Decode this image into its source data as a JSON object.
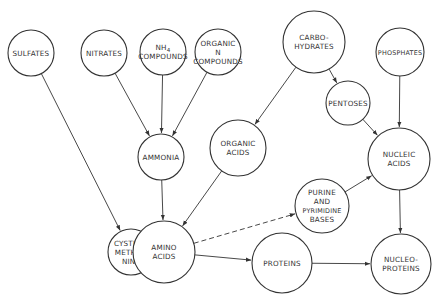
{
  "diagram": {
    "type": "metabolic-flow",
    "nodes": [
      {
        "id": "sulfates",
        "lines": [
          "SULFATES"
        ],
        "cx": 31,
        "cy": 53,
        "r": 23
      },
      {
        "id": "nitrates",
        "lines": [
          "NITRATES"
        ],
        "cx": 104,
        "cy": 53,
        "r": 23
      },
      {
        "id": "nh4",
        "lines": [
          "NH4",
          "COMPOUNDS"
        ],
        "cx": 163,
        "cy": 52,
        "r": 23
      },
      {
        "id": "organic_n",
        "lines": [
          "ORGANIC",
          "N",
          "COMPOUNDS"
        ],
        "cx": 218,
        "cy": 52,
        "r": 23
      },
      {
        "id": "carbohydrates",
        "lines": [
          "CARBO-",
          "HYDRATES"
        ],
        "cx": 314,
        "cy": 42,
        "r": 31
      },
      {
        "id": "phosphates",
        "lines": [
          "PHOSPHATES"
        ],
        "cx": 400,
        "cy": 52,
        "r": 24
      },
      {
        "id": "pentoses",
        "lines": [
          "PENTOSES"
        ],
        "cx": 348,
        "cy": 103,
        "r": 22
      },
      {
        "id": "ammonia",
        "lines": [
          "AMMONIA"
        ],
        "cx": 161,
        "cy": 157,
        "r": 23
      },
      {
        "id": "organic_acids",
        "lines": [
          "ORGANIC",
          "ACIDS"
        ],
        "cx": 238,
        "cy": 148,
        "r": 28
      },
      {
        "id": "nucleic_acids",
        "lines": [
          "NUCLEIC",
          "ACIDS"
        ],
        "cx": 399,
        "cy": 159,
        "r": 31
      },
      {
        "id": "purine",
        "lines": [
          "PURINE",
          "AND",
          "PYRIMIDINE",
          "BASES"
        ],
        "cx": 322,
        "cy": 206,
        "r": 27
      },
      {
        "id": "cystine",
        "lines": [
          "CYSTINE,",
          "METHIO-",
          "NINE"
        ],
        "cx": 131,
        "cy": 252,
        "r": 23
      },
      {
        "id": "amino_acids",
        "lines": [
          "AMINO",
          "ACIDS"
        ],
        "cx": 164,
        "cy": 252,
        "r": 31
      },
      {
        "id": "proteins",
        "lines": [
          "PROTEINS"
        ],
        "cx": 282,
        "cy": 263,
        "r": 30
      },
      {
        "id": "nucleoproteins",
        "lines": [
          "NUCLEO-",
          "PROTEINS"
        ],
        "cx": 401,
        "cy": 264,
        "r": 30
      }
    ],
    "edges": [
      {
        "from": "sulfates",
        "to": "cystine",
        "style": "solid"
      },
      {
        "from": "nitrates",
        "to": "ammonia",
        "style": "solid"
      },
      {
        "from": "nh4",
        "to": "ammonia",
        "style": "solid"
      },
      {
        "from": "organic_n",
        "to": "ammonia",
        "style": "solid"
      },
      {
        "from": "carbohydrates",
        "to": "organic_acids",
        "style": "solid"
      },
      {
        "from": "carbohydrates",
        "to": "pentoses",
        "style": "solid"
      },
      {
        "from": "phosphates",
        "to": "nucleic_acids",
        "style": "solid"
      },
      {
        "from": "pentoses",
        "to": "nucleic_acids",
        "style": "solid"
      },
      {
        "from": "ammonia",
        "to": "amino_acids",
        "style": "solid"
      },
      {
        "from": "organic_acids",
        "to": "amino_acids",
        "style": "solid"
      },
      {
        "from": "amino_acids",
        "to": "purine",
        "style": "dashed"
      },
      {
        "from": "purine",
        "to": "nucleic_acids",
        "style": "solid"
      },
      {
        "from": "amino_acids",
        "to": "proteins",
        "style": "solid"
      },
      {
        "from": "proteins",
        "to": "nucleoproteins",
        "style": "solid"
      },
      {
        "from": "nucleic_acids",
        "to": "nucleoproteins",
        "style": "solid"
      }
    ]
  }
}
